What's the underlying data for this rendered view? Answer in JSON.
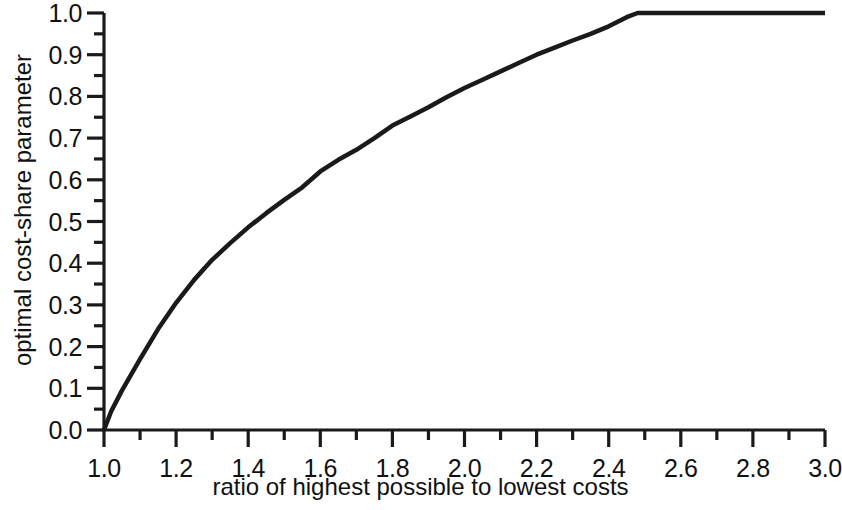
{
  "chart_data": {
    "type": "line",
    "title": "",
    "subtitle": "",
    "xlabel": "ratio of highest possible to lowest costs",
    "ylabel": "optimal cost-share parameter",
    "xlim": [
      1.0,
      3.0
    ],
    "ylim": [
      0.0,
      1.0
    ],
    "grid": false,
    "legend": null,
    "x_major_ticks": [
      1.0,
      1.2,
      1.4,
      1.6,
      1.8,
      2.0,
      2.2,
      2.4,
      2.6,
      2.8,
      3.0
    ],
    "x_minor_ticks": [
      1.1,
      1.3,
      1.5,
      1.7,
      1.9,
      2.1,
      2.3,
      2.5,
      2.7,
      2.9
    ],
    "x_tick_labels": [
      "1.0",
      "1.2",
      "1.4",
      "1.6",
      "1.8",
      "2.0",
      "2.2",
      "2.4",
      "2.6",
      "2.8",
      "3.0"
    ],
    "y_major_ticks": [
      0.0,
      0.1,
      0.2,
      0.3,
      0.4,
      0.5,
      0.6,
      0.7,
      0.8,
      0.9,
      1.0
    ],
    "y_minor_ticks": [
      0.05,
      0.15,
      0.25,
      0.35,
      0.45,
      0.55,
      0.65,
      0.75,
      0.85,
      0.95
    ],
    "y_tick_labels": [
      "0.0",
      "0.1",
      "0.2",
      "0.3",
      "0.4",
      "0.5",
      "0.6",
      "0.7",
      "0.8",
      "0.9",
      "1.0"
    ],
    "line_color": "#1a1a1a",
    "line_width": 4.5,
    "saturation_point": {
      "x": 2.48,
      "y": 1.0
    },
    "series": [
      {
        "name": "optimal cost-share parameter",
        "x": [
          1.0,
          1.02,
          1.05,
          1.08,
          1.1,
          1.15,
          1.2,
          1.25,
          1.3,
          1.35,
          1.4,
          1.45,
          1.5,
          1.55,
          1.6,
          1.65,
          1.7,
          1.75,
          1.8,
          1.85,
          1.9,
          1.95,
          2.0,
          2.05,
          2.1,
          2.15,
          2.2,
          2.25,
          2.3,
          2.35,
          2.4,
          2.45,
          2.48,
          2.6,
          2.8,
          3.0
        ],
        "y": [
          0.0,
          0.045,
          0.095,
          0.14,
          0.17,
          0.242,
          0.305,
          0.36,
          0.408,
          0.448,
          0.486,
          0.52,
          0.552,
          0.582,
          0.62,
          0.648,
          0.672,
          0.7,
          0.73,
          0.752,
          0.774,
          0.798,
          0.82,
          0.84,
          0.86,
          0.88,
          0.9,
          0.917,
          0.934,
          0.95,
          0.968,
          0.99,
          1.0,
          1.0,
          1.0,
          1.0
        ]
      }
    ]
  },
  "axes": {
    "x_axis_name": "x-axis",
    "y_axis_name": "y-axis"
  }
}
